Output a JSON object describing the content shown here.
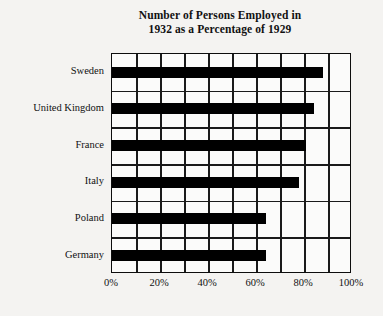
{
  "chart_data": {
    "type": "bar",
    "orientation": "horizontal",
    "title": "Number of Persons Employed in 1932 as a Percentage of 1929",
    "title_lines": [
      "Number of Persons Employed in",
      "1932 as a Percentage of 1929"
    ],
    "categories": [
      "Sweden",
      "United Kingdom",
      "France",
      "Italy",
      "Poland",
      "Germany"
    ],
    "values": [
      88,
      84,
      81,
      78,
      64,
      64
    ],
    "xlabel": "",
    "ylabel": "",
    "xlim": [
      0,
      100
    ],
    "x_tick_labels": [
      "0%",
      "20%",
      "40%",
      "60%",
      "80%",
      "100%"
    ],
    "x_tick_values": [
      0,
      20,
      40,
      60,
      80,
      100
    ],
    "x_minor_gridline_values": [
      0,
      10,
      20,
      30,
      40,
      50,
      60,
      70,
      80,
      90,
      100
    ],
    "grid": true,
    "legend": "none",
    "series_color": "#000000",
    "frame_color": "#0d0d0d",
    "plot_background": "#fbfbfa",
    "page_background": "#f4f3f1"
  }
}
